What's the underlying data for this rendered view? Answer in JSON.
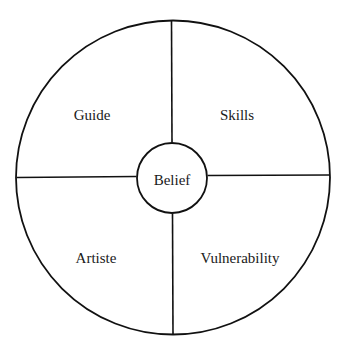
{
  "diagram": {
    "type": "quadrant-wheel",
    "colors": {
      "stroke": "#111111",
      "background": "#ffffff",
      "text": "#1a1a1a"
    },
    "center": {
      "label": "Belief"
    },
    "quadrants": [
      {
        "position": "top-left",
        "label": "Guide"
      },
      {
        "position": "top-right",
        "label": "Skills"
      },
      {
        "position": "bottom-left",
        "label": "Artiste"
      },
      {
        "position": "bottom-right",
        "label": "Vulnerability"
      }
    ]
  }
}
